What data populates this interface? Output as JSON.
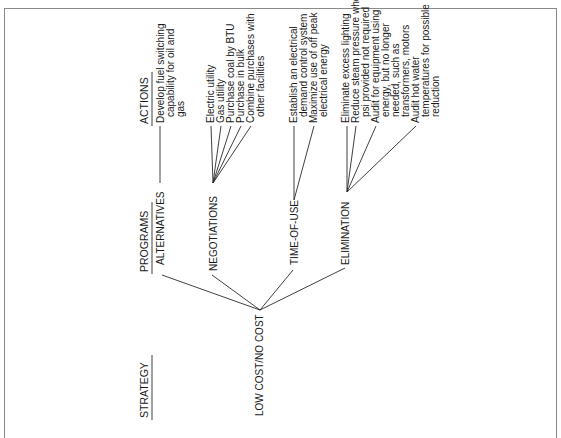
{
  "headers": {
    "strategy": "STRATEGY",
    "programs": "PROGRAMS",
    "actions": "ACTIONS"
  },
  "strategy": {
    "label": "LOW COST/NO COST"
  },
  "programs": [
    {
      "label": "ALTERNATIVES",
      "actions": [
        [
          "Develop fuel switching",
          "capability for oil and",
          "gas"
        ]
      ]
    },
    {
      "label": "NEGOTIATIONS",
      "actions": [
        [
          "Electric utility"
        ],
        [
          "Gas utility"
        ],
        [
          "Purchase coal by BTU"
        ],
        [
          "Purchase in bulk"
        ],
        [
          "Combine purchases with",
          "other facilities"
        ]
      ]
    },
    {
      "label": "TIME-OF-USE",
      "actions": [
        [
          "Establish an electrical",
          "demand control system"
        ],
        [
          "Maximize use of off peak",
          "electrical energy"
        ]
      ]
    },
    {
      "label": "ELIMINATION",
      "actions": [
        [
          "Eliminate excess lighting"
        ],
        [
          "Reduce steam pressure where",
          "psi provided not required"
        ],
        [
          "Audit for equipment using",
          "energy, but no longer",
          "needed, such as",
          "transformers, motors"
        ],
        [
          "Audit hot water",
          "temperatures for possible",
          "reduction"
        ]
      ]
    }
  ]
}
